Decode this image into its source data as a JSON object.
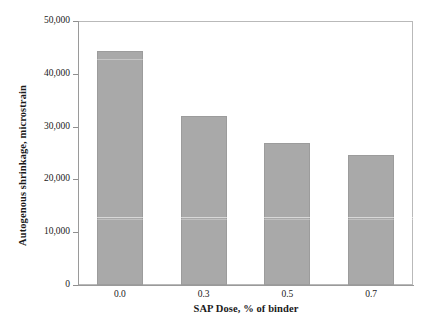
{
  "chart_data": {
    "type": "bar",
    "title": "",
    "xlabel": "SAP Dose, % of binder",
    "ylabel": "Autogenous shrinkage, microstrain",
    "categories": [
      "0.0",
      "0.3",
      "0.5",
      "0.7"
    ],
    "values": [
      44300,
      32000,
      26900,
      24600
    ],
    "ylim": [
      0,
      50000
    ],
    "yticks": [
      "0",
      "10,000",
      "20,000",
      "30,000",
      "40,000",
      "50,000"
    ],
    "ytick_values": [
      0,
      10000,
      20000,
      30000,
      40000,
      50000
    ],
    "grid": false,
    "legend": false,
    "bar_color": "#a9a9a9",
    "frame_color": "#b9b9b9",
    "text_color": "#1a1a1a"
  }
}
